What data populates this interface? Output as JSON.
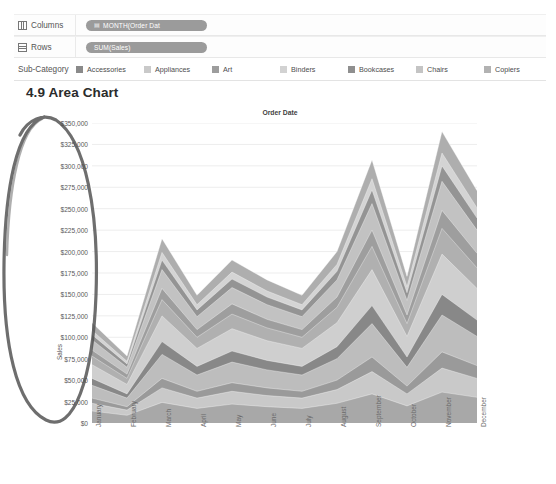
{
  "shelves": [
    {
      "name": "Columns",
      "label": "Columns",
      "icon": "columns-grid-icon",
      "pill": "MONTH(Order Dat",
      "pill_icon": "calendar-icon"
    },
    {
      "name": "Rows",
      "label": "Rows",
      "icon": "rows-grid-icon",
      "pill": "SUM(Sales)",
      "pill_icon": ""
    }
  ],
  "legend": {
    "title": "Sub-Category",
    "items": [
      {
        "label": "Accessories",
        "color": "#8a8a8a"
      },
      {
        "label": "Appliances",
        "color": "#c9c9c9"
      },
      {
        "label": "Art",
        "color": "#9d9d9d"
      },
      {
        "label": "Binders",
        "color": "#d2d2d2"
      },
      {
        "label": "Bookcases",
        "color": "#8f8f8f"
      },
      {
        "label": "Chairs",
        "color": "#c4c4c4"
      },
      {
        "label": "Copiers",
        "color": "#b2b2b2"
      }
    ]
  },
  "page_title": "4.9 Area Chart",
  "annotation": {
    "type": "hand-drawn-ellipse",
    "color": "#4f4f4f",
    "target": "y-axis"
  },
  "chart_data": {
    "type": "area",
    "title": "Order Date",
    "xlabel": "",
    "ylabel": "Sales",
    "ylim": [
      0,
      350000
    ],
    "ytick_labels": [
      "$350,000",
      "$325,000",
      "$300,000",
      "$275,000",
      "$250,000",
      "$225,000",
      "$200,000",
      "$175,000",
      "$150,000",
      "$125,000",
      "$100,000",
      "$75,000",
      "$50,000",
      "$25,000",
      "$0"
    ],
    "ytick_values": [
      350000,
      325000,
      300000,
      275000,
      250000,
      225000,
      200000,
      175000,
      150000,
      125000,
      100000,
      75000,
      50000,
      25000,
      0
    ],
    "grid": true,
    "legend_position": "top",
    "stacked": true,
    "categories": [
      "January",
      "February",
      "March",
      "April",
      "May",
      "June",
      "July",
      "August",
      "September",
      "October",
      "November",
      "December"
    ],
    "series": [
      {
        "name": "Accessories",
        "color": "#a8a8a8",
        "values": [
          14000,
          9000,
          24000,
          17000,
          22000,
          19000,
          17000,
          23000,
          34000,
          20000,
          36000,
          30000
        ]
      },
      {
        "name": "Appliances",
        "color": "#c9c9c9",
        "values": [
          9000,
          6000,
          17000,
          12000,
          15000,
          13000,
          12000,
          16000,
          26000,
          14000,
          28000,
          22000
        ]
      },
      {
        "name": "Art",
        "color": "#9a9a9a",
        "values": [
          6000,
          4000,
          11000,
          8000,
          10000,
          9000,
          8000,
          11000,
          17000,
          9000,
          19000,
          15000
        ]
      },
      {
        "name": "Binders",
        "color": "#bdbdbd",
        "values": [
          15000,
          10000,
          28000,
          19000,
          24000,
          21000,
          19000,
          25000,
          39000,
          22000,
          43000,
          34000
        ]
      },
      {
        "name": "Bookcases",
        "color": "#888888",
        "values": [
          8000,
          5000,
          15000,
          10000,
          13000,
          11000,
          10000,
          14000,
          21000,
          12000,
          24000,
          19000
        ]
      },
      {
        "name": "Chairs",
        "color": "#cfcfcf",
        "values": [
          16000,
          11000,
          30000,
          21000,
          26000,
          23000,
          21000,
          28000,
          42000,
          24000,
          47000,
          37000
        ]
      },
      {
        "name": "Copiers",
        "color": "#b0b0b0",
        "values": [
          10000,
          7000,
          19000,
          13000,
          17000,
          15000,
          13000,
          18000,
          27000,
          15000,
          30000,
          24000
        ]
      },
      {
        "name": "Band 8",
        "color": "#9e9e9e",
        "values": [
          7000,
          5000,
          13000,
          9000,
          12000,
          10000,
          9000,
          12000,
          19000,
          10000,
          21000,
          17000
        ]
      },
      {
        "name": "Band 9",
        "color": "#c2c2c2",
        "values": [
          12000,
          8000,
          22000,
          15000,
          19000,
          17000,
          15000,
          20000,
          31000,
          17000,
          34000,
          27000
        ]
      },
      {
        "name": "Band 10",
        "color": "#949494",
        "values": [
          6000,
          4000,
          11000,
          8000,
          10000,
          9000,
          8000,
          10000,
          16000,
          9000,
          18000,
          14000
        ]
      },
      {
        "name": "Band 11",
        "color": "#d4d4d4",
        "values": [
          5000,
          3000,
          9000,
          6000,
          8000,
          7000,
          6000,
          8000,
          13000,
          7000,
          15000,
          12000
        ]
      },
      {
        "name": "Band 12",
        "color": "#aeaeae",
        "values": [
          9000,
          6000,
          16000,
          11000,
          14000,
          13000,
          11000,
          15000,
          22000,
          12000,
          25000,
          20000
        ]
      }
    ],
    "totals": [
      117000,
      78000,
      215000,
      149000,
      190000,
      167000,
      149000,
      200000,
      307000,
      171000,
      340000,
      271000
    ]
  }
}
